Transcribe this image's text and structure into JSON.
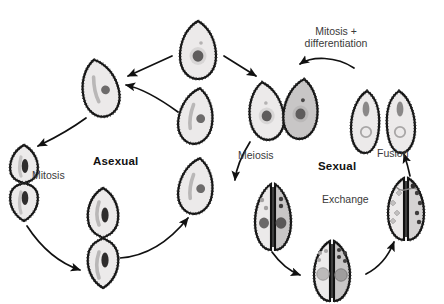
{
  "diagram": {
    "title_visible": false,
    "background_color": "#ffffff",
    "organism": "ciliate cell",
    "labels": {
      "asexual": "Asexual",
      "sexual": "Sexual",
      "mitosis": "Mitosis",
      "meiosis": "Meiosis",
      "fusion": "Fusion",
      "exchange": "Exchange",
      "mitosis_differentiation_line1": "Mitosis +",
      "mitosis_differentiation_line2": "differentiation"
    },
    "colors": {
      "outline": "#111111",
      "cell_fill_light": "#eceaea",
      "cell_fill_dark": "#c8c6c6",
      "macronucleus_dark": "#5e5c5c",
      "macronucleus_halo": "#d8d6d6",
      "micronucleus": "#8a8888",
      "oral_groove": "#b9b7b7",
      "arrow": "#111111",
      "label_major": "#111111",
      "label_minor": "#3a3a3a"
    },
    "label_positions": {
      "asexual": {
        "x": 93,
        "y": 155
      },
      "sexual": {
        "x": 318,
        "y": 160
      },
      "mitosis": {
        "x": 32,
        "y": 170
      },
      "meiosis": {
        "x": 238,
        "y": 150
      },
      "fusion": {
        "x": 377,
        "y": 148
      },
      "exchange": {
        "x": 322,
        "y": 194
      },
      "mitosis_differentiation": {
        "x": 288,
        "y": 26
      }
    },
    "cells": [
      {
        "id": "top-parent",
        "name": "parent-cell",
        "x": 180,
        "y": 21,
        "w": 37,
        "h": 58,
        "fill": "light",
        "tilt": 0,
        "nucleus": "halo-dark",
        "micronucleus": true
      },
      {
        "id": "asex-upper-left",
        "name": "asexual-daughter-upper",
        "x": 82,
        "y": 59,
        "w": 37,
        "h": 58,
        "fill": "light",
        "tilt": -12,
        "nucleus": "dot",
        "groove": true
      },
      {
        "id": "asex-right-upper",
        "name": "asexual-cell-right-upper",
        "x": 178,
        "y": 88,
        "w": 36,
        "h": 56,
        "fill": "light",
        "tilt": 8,
        "nucleus": "dot",
        "groove": true
      },
      {
        "id": "asex-right-lower",
        "name": "asexual-cell-right-lower",
        "x": 178,
        "y": 158,
        "w": 36,
        "h": 56,
        "fill": "light",
        "tilt": 8,
        "nucleus": "dot",
        "groove": true
      },
      {
        "id": "asex-dividing-left",
        "name": "dividing-cell-mitosis",
        "x": 6,
        "y": 145,
        "w": 36,
        "h": 76,
        "fill": "light",
        "tilt": 0,
        "nucleus": "split",
        "dividing": true
      },
      {
        "id": "asex-dividing-bot",
        "name": "dividing-cell-cytokinesis",
        "x": 84,
        "y": 188,
        "w": 38,
        "h": 100,
        "fill": "light",
        "tilt": 0,
        "nucleus": "split",
        "dividing": true
      },
      {
        "id": "sex-entry-left",
        "name": "sexual-entry-cell-left",
        "x": 248,
        "y": 82,
        "w": 36,
        "h": 58,
        "fill": "light",
        "tilt": -8,
        "nucleus": "halo-dark",
        "micronucleus": true
      },
      {
        "id": "sex-entry-right",
        "name": "sexual-entry-cell-right",
        "x": 283,
        "y": 79,
        "w": 36,
        "h": 60,
        "fill": "dark",
        "tilt": 6,
        "nucleus": "halo-dark",
        "micronucleus": true
      },
      {
        "id": "post-fusion-left",
        "name": "post-fusion-cell-left",
        "x": 349,
        "y": 91,
        "w": 33,
        "h": 62,
        "fill": "light",
        "tilt": 0,
        "nucleus": "bar-ring"
      },
      {
        "id": "post-fusion-right",
        "name": "post-fusion-cell-right",
        "x": 385,
        "y": 91,
        "w": 33,
        "h": 62,
        "fill": "light",
        "tilt": 0,
        "nucleus": "bar-ring"
      },
      {
        "id": "conj-meiosis",
        "name": "conjugating-pair-meiosis",
        "x": 237,
        "y": 184,
        "w": 72,
        "h": 66,
        "fill": "pair",
        "nucleus": "meiosis-dots"
      },
      {
        "id": "conj-bottom",
        "name": "conjugating-pair-multinucleate",
        "x": 296,
        "y": 241,
        "w": 72,
        "h": 60,
        "fill": "pair",
        "nucleus": "many-dots"
      },
      {
        "id": "conj-exchange",
        "name": "conjugating-pair-exchange",
        "x": 372,
        "y": 178,
        "w": 68,
        "h": 62,
        "fill": "pair",
        "nucleus": "exchange-bridge"
      }
    ],
    "arrows": [
      {
        "name": "arrow-parent-to-asexual",
        "from": "top-parent",
        "to": "asex-upper-left"
      },
      {
        "name": "arrow-parent-to-sexual",
        "from": "top-parent",
        "to": "sex-entry-left"
      },
      {
        "name": "arrow-asexual-right-to-upper-left",
        "from": "asex-right-upper",
        "to": "asex-upper-left"
      },
      {
        "name": "arrow-asexual-upper-left-to-mitosis",
        "from": "asex-upper-left",
        "to": "asex-dividing-left"
      },
      {
        "name": "arrow-mitosis-to-cytokinesis",
        "from": "asex-dividing-left",
        "to": "asex-dividing-bot"
      },
      {
        "name": "arrow-cytokinesis-to-right",
        "from": "asex-dividing-bot",
        "to": "asex-right-lower"
      },
      {
        "name": "arrow-mitosis-differentiation",
        "from": "post-fusion-left",
        "to": "sex-entry-right"
      },
      {
        "name": "arrow-meiosis",
        "from": "sex-entry-left",
        "to": "conj-meiosis"
      },
      {
        "name": "arrow-meiosis-to-bottom",
        "from": "conj-meiosis",
        "to": "conj-bottom"
      },
      {
        "name": "arrow-bottom-to-exchange",
        "from": "conj-bottom",
        "to": "conj-exchange"
      },
      {
        "name": "arrow-fusion",
        "from": "conj-exchange",
        "to": "post-fusion-right"
      }
    ]
  }
}
